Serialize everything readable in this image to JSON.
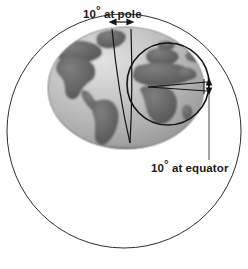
{
  "figure": {
    "background_color": "#ffffff",
    "ink_color": "#1a1a1a"
  },
  "labels": {
    "pole": {
      "value": "10",
      "degree_symbol": "°",
      "text": " at pole",
      "full": "10° at pole"
    },
    "equator": {
      "value": "10",
      "degree_symbol": "°",
      "text": " at equator",
      "full": "10° at equator"
    }
  },
  "shapes": {
    "outer_circle": {
      "name": "outer-reference-circle",
      "cx": 124,
      "cy": 131,
      "r": 117,
      "stroke": "#2b2b2b",
      "fill": "none"
    },
    "globe": {
      "name": "earth-globe",
      "cx": 126,
      "cy": 88,
      "rx": 78,
      "ry": 61,
      "ocean_color": "#b9b9b9",
      "land_color": "#6e6e6e"
    },
    "inset_circle": {
      "name": "equator-extent-circle",
      "cx": 168,
      "cy": 84,
      "r": 41,
      "stroke": "#151515",
      "fill": "none"
    },
    "meridian_lines": {
      "name": "meridian-convergence-lines",
      "apex_x": 130,
      "apex_y": 143,
      "top_left_x": 112,
      "top_right_x": 131,
      "top_y": 29
    },
    "pole_arrow": {
      "name": "pole-span-arrow",
      "x1": 112,
      "x2": 131,
      "y": 22
    },
    "equator_arrow": {
      "name": "equator-span-arrow",
      "x": 209,
      "y1": 81,
      "y2": 93
    },
    "leader_line": {
      "name": "equator-label-leader",
      "x": 209,
      "y1": 93,
      "y2": 160
    }
  }
}
